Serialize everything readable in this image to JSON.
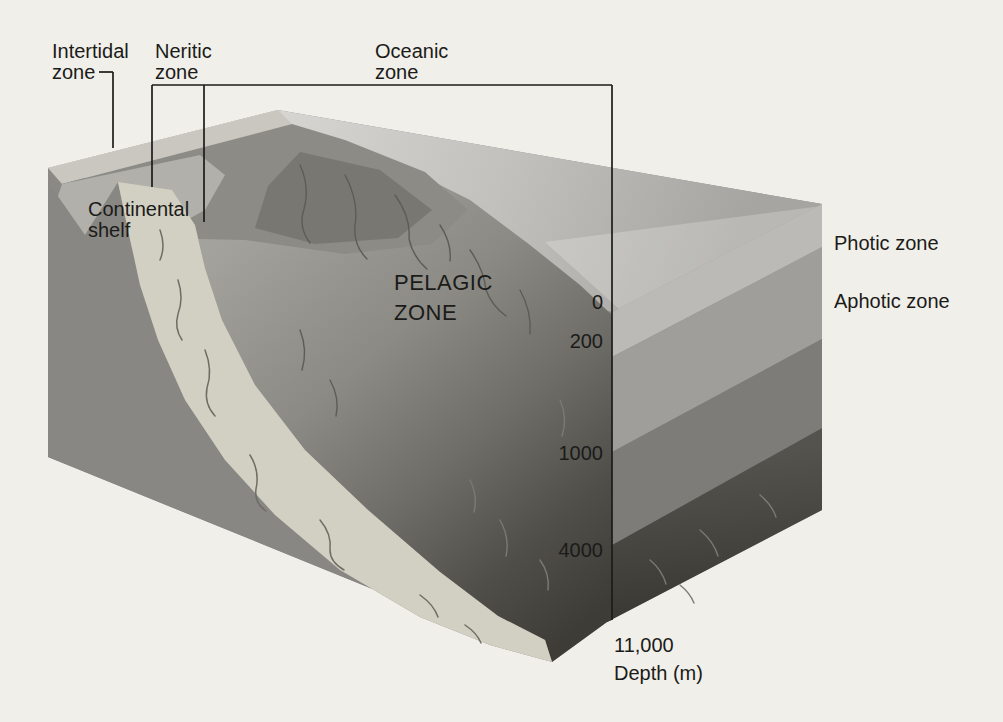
{
  "figure": {
    "type": "ocean-zonation-block-diagram",
    "labels": {
      "intertidal": {
        "line1": "Intertidal",
        "line2": "zone"
      },
      "neritic": {
        "line1": "Neritic",
        "line2": "zone"
      },
      "oceanic": {
        "line1": "Oceanic",
        "line2": "zone"
      },
      "continental_shelf": {
        "line1": "Continental",
        "line2": "shelf"
      },
      "pelagic": {
        "line1": "PELAGIC",
        "line2": "ZONE"
      },
      "photic": "Photic zone",
      "aphotic": "Aphotic zone"
    },
    "depth_scale": {
      "ticks": [
        "0",
        "200",
        "1000",
        "4000",
        "11,000"
      ],
      "axis_label": "Depth (m)"
    },
    "palette": {
      "background": "#f1efe9",
      "text": "#1b1b19",
      "line": "#1c1c1a",
      "block_base": "#8a8985",
      "sea_surface_light": "#dcdbd7",
      "sea_surface_dark": "#a6a5a1",
      "beach": "#c9c7c0",
      "shelf_bench": "#b2b0aa",
      "land_mass": "#8c8b86",
      "land_mass_dark": "#787772",
      "left_face": "#888783",
      "canyon": "#d2cfc3",
      "band_photic": "#bbbab6",
      "band_200_1000": "#9f9e9a",
      "band_1000_4000": "#7d7c78",
      "band_4000_top": "#54534e",
      "band_4000_bottom": "#393833",
      "slope_top": "#a3a29d",
      "slope_bottom": "#3d3c37"
    }
  }
}
